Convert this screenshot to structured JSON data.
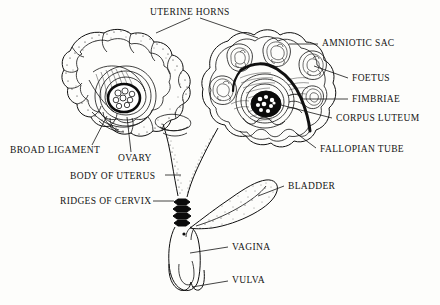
{
  "figure": {
    "title_text": "Diagram of the reproductive tract of a pregnant sow / bitch, ventral view",
    "type": "anatomical-line-diagram",
    "background_color": "#fdfdfb",
    "ink_color": "#101010",
    "labels": [
      {
        "id": "uterine-horns",
        "text": "UTERINE HORNS",
        "x": 150,
        "y": 14,
        "align": "left"
      },
      {
        "id": "amniotic-sac",
        "text": "AMNIOTIC SAC",
        "x": 322,
        "y": 45,
        "align": "left"
      },
      {
        "id": "foetus",
        "text": "FOETUS",
        "x": 352,
        "y": 80,
        "align": "left"
      },
      {
        "id": "fimbriae",
        "text": "FIMBRIAE",
        "x": 352,
        "y": 101,
        "align": "left"
      },
      {
        "id": "corpus-luteum",
        "text": "CORPUS LUTEUM",
        "x": 336,
        "y": 120,
        "align": "left"
      },
      {
        "id": "fallopian-tube",
        "text": "FALLOPIAN TUBE",
        "x": 320,
        "y": 151,
        "align": "left"
      },
      {
        "id": "broad-ligament",
        "text": "BROAD LIGAMENT",
        "x": 10,
        "y": 152,
        "align": "left"
      },
      {
        "id": "ovary",
        "text": "OVARY",
        "x": 118,
        "y": 160,
        "align": "left"
      },
      {
        "id": "body-of-uterus",
        "text": "BODY OF UTERUS",
        "x": 70,
        "y": 178,
        "align": "left"
      },
      {
        "id": "ridges-of-cervix",
        "text": "RIDGES OF CERVIX",
        "x": 60,
        "y": 204,
        "align": "left"
      },
      {
        "id": "bladder",
        "text": "BLADDER",
        "x": 288,
        "y": 189,
        "align": "left"
      },
      {
        "id": "vagina",
        "text": "VAGINA",
        "x": 232,
        "y": 250,
        "align": "left"
      },
      {
        "id": "vulva",
        "text": "VULVA",
        "x": 232,
        "y": 283,
        "align": "left"
      }
    ],
    "structures": [
      {
        "id": "left-uterine-horn",
        "name": "left uterine horn (non-gravid, coiled, stippled)"
      },
      {
        "id": "right-uterine-horn",
        "name": "right uterine horn (gravid, opened, four foetuses)"
      },
      {
        "id": "left-ovary",
        "name": "left ovary with follicles"
      },
      {
        "id": "right-ovary",
        "name": "right ovary with corpus luteum"
      },
      {
        "id": "uterus-body",
        "name": "body of uterus"
      },
      {
        "id": "cervix",
        "name": "cervix with four dark transverse ridges"
      },
      {
        "id": "vagina-tube",
        "name": "vagina"
      },
      {
        "id": "vulva-opening",
        "name": "vulva"
      },
      {
        "id": "bladder-shape",
        "name": "urinary bladder"
      },
      {
        "id": "fallopian-tube-arc",
        "name": "fallopian tube (thick dark arc)"
      },
      {
        "id": "broad-ligament-fan",
        "name": "broad ligament (hatched fan)"
      }
    ]
  }
}
